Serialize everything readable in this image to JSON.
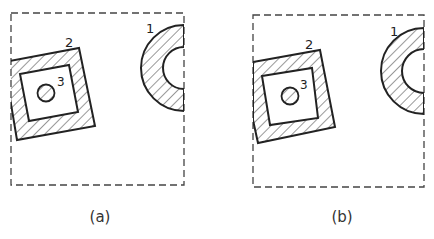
{
  "figure": {
    "panels": [
      {
        "caption": "(a)",
        "labels": {
          "arc": "1",
          "square": "2",
          "circle": "3"
        },
        "description": "Clipping window (dashed) with shapes extending beyond the left and right edges (unclipped)"
      },
      {
        "caption": "(b)",
        "labels": {
          "arc": "1",
          "square": "2",
          "circle": "3"
        },
        "description": "Same shapes clipped to the window boundary"
      }
    ],
    "colors": {
      "stroke": "#222222",
      "dashed": "#444444",
      "background": "#ffffff"
    }
  }
}
